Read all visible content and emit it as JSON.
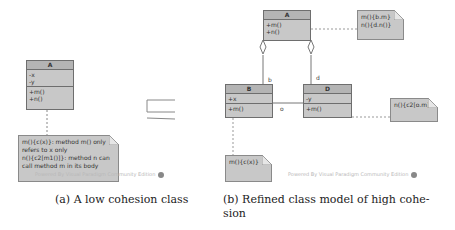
{
  "figure_a": {
    "class_a": {
      "name": "A",
      "attributes": [
        "-x",
        "-y"
      ],
      "operations": [
        "+m()",
        "+n()"
      ]
    },
    "note": {
      "lines": [
        "m(){c(x)}: method m() only",
        "refers to x only",
        "n(){c2[m1()]}: method n can",
        "call method m in its body"
      ]
    },
    "watermark": "Powered By Visual Paradigm Community Edition",
    "caption": "(a) A low cohesion class"
  },
  "equivalence_symbol": "≡",
  "figure_b": {
    "class_a": {
      "name": "A",
      "operations": [
        "+m()",
        "+n()"
      ]
    },
    "class_b": {
      "name": "B",
      "attributes": [
        "+x"
      ],
      "operations": [
        "+m()"
      ]
    },
    "class_d": {
      "name": "D",
      "attributes": [
        "-y"
      ],
      "operations": [
        "+m()"
      ]
    },
    "role_b": "b",
    "role_d": "d",
    "role_o": "o",
    "note_a": {
      "lines": [
        "m(){b.m}",
        "n(){d.n()}"
      ]
    },
    "note_d": {
      "lines": [
        "n(){c2[o.m]}"
      ]
    },
    "note_b": {
      "lines": [
        "m(){c(x)}"
      ]
    },
    "watermark": "Powered By Visual Paradigm Community Edition",
    "caption_line1": "(b) Refined class model of high cohe-",
    "caption_line2": "sion"
  },
  "colors": {
    "class_fill": "#c8c8c8",
    "class_header": "#b4b4b4",
    "border": "#6e6e6e",
    "watermark": "#b8b8b8"
  }
}
